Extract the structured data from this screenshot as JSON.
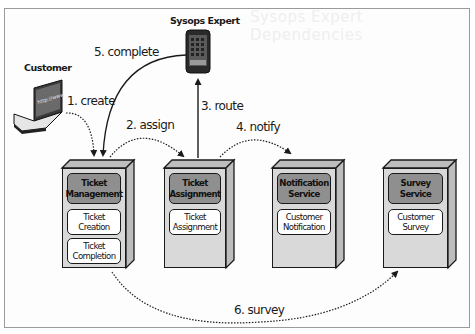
{
  "diagram": {
    "background_ghost_text": "Sysops Expert Dependencies",
    "actors": {
      "customer": {
        "label": "Customer",
        "device": "laptop",
        "screen_text": "http://www"
      },
      "expert": {
        "label": "Sysops Expert",
        "device": "tablet"
      }
    },
    "services": [
      {
        "id": "ticket-management",
        "title_line1": "Ticket",
        "title_line2": "Management",
        "components": [
          {
            "line1": "Ticket",
            "line2": "Creation"
          },
          {
            "line1": "Ticket",
            "line2": "Completion"
          }
        ]
      },
      {
        "id": "ticket-assignment",
        "title_line1": "Ticket",
        "title_line2": "Assignment",
        "components": [
          {
            "line1": "Ticket",
            "line2": "Assignment"
          }
        ]
      },
      {
        "id": "notification-service",
        "title_line1": "Notification",
        "title_line2": "Service",
        "components": [
          {
            "line1": "Customer",
            "line2": "Notification"
          }
        ]
      },
      {
        "id": "survey-service",
        "title_line1": "Survey",
        "title_line2": "Service",
        "components": [
          {
            "line1": "Customer",
            "line2": "Survey"
          }
        ]
      }
    ],
    "flows": [
      {
        "step": 1,
        "label": "1. create",
        "from": "Customer",
        "to": "Ticket Management",
        "style": "dotted"
      },
      {
        "step": 2,
        "label": "2. assign",
        "from": "Ticket Management",
        "to": "Ticket Assignment",
        "style": "dotted"
      },
      {
        "step": 3,
        "label": "3. route",
        "from": "Ticket Assignment",
        "to": "Sysops Expert",
        "style": "solid"
      },
      {
        "step": 4,
        "label": "4. notify",
        "from": "Ticket Assignment",
        "to": "Notification Service",
        "style": "dotted"
      },
      {
        "step": 5,
        "label": "5. complete",
        "from": "Sysops Expert",
        "to": "Ticket Management",
        "style": "solid"
      },
      {
        "step": 6,
        "label": "6. survey",
        "from": "Ticket Management",
        "to": "Survey Service",
        "style": "dotted"
      }
    ],
    "colors": {
      "service_body": "#d9d9d9",
      "service_title": "#8f8f8f",
      "component": "#ffffff",
      "stroke": "#1a1a1a"
    }
  }
}
